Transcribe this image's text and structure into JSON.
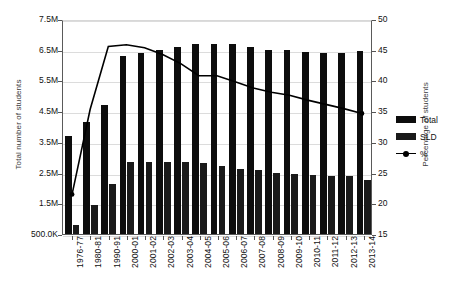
{
  "chart_data": {
    "type": "bar",
    "title": "",
    "subtitle": "",
    "xlabel": "",
    "ylabel": "Total number of students",
    "y2label": "Percentage of students",
    "grid": true,
    "legend_position": "right",
    "categories": [
      "1976-77",
      "1980-81",
      "1990-91",
      "2000-01",
      "2001-02",
      "2002-03",
      "2003-04",
      "2004-05",
      "2005-06",
      "2006-07",
      "2007-08",
      "2008-09",
      "2009-10",
      "2010-11",
      "2011-12",
      "2012-13",
      "2013-14"
    ],
    "ylim": [
      500000,
      7500000
    ],
    "yticks": [
      500000,
      1500000,
      2500000,
      3500000,
      4500000,
      5500000,
      6500000,
      7500000
    ],
    "ytick_labels": [
      "500.0K",
      "1.5M",
      "2.5M",
      "3.5M",
      "4.5M",
      "5.5M",
      "6.5M",
      "7.5M"
    ],
    "y2lim": [
      15,
      50
    ],
    "y2ticks": [
      15,
      20,
      25,
      30,
      35,
      40,
      45,
      50
    ],
    "y2tick_labels": [
      "15",
      "20",
      "25",
      "30",
      "35",
      "40",
      "45",
      "50"
    ],
    "series": [
      {
        "name": "Total",
        "axis": "left",
        "color": "#0d0d0d",
        "values": [
          3700000,
          4150000,
          4710000,
          6290000,
          6400000,
          6500000,
          6600000,
          6700000,
          6700000,
          6680000,
          6600000,
          6480000,
          6480000,
          6430000,
          6400000,
          6400000,
          6460000
        ]
      },
      {
        "name": "SLD",
        "axis": "left",
        "color": "#1a1a1a",
        "values": [
          800000,
          1460000,
          2130000,
          2860000,
          2860000,
          2850000,
          2830000,
          2800000,
          2730000,
          2620000,
          2570000,
          2480000,
          2450000,
          2420000,
          2400000,
          2390000,
          2270000
        ]
      },
      {
        "name": "%",
        "axis": "right",
        "color": "#000000",
        "values": [
          21.5,
          35.5,
          45.8,
          46.1,
          45.6,
          44.5,
          43.0,
          41.0,
          41.0,
          40.0,
          39.0,
          38.3,
          37.8,
          37.0,
          36.3,
          35.6,
          34.8
        ]
      }
    ]
  },
  "legend": {
    "items": [
      {
        "label": "Total",
        "kind": "swatch"
      },
      {
        "label": "SLD",
        "kind": "swatch"
      },
      {
        "label": "%",
        "kind": "line-marker"
      }
    ]
  }
}
